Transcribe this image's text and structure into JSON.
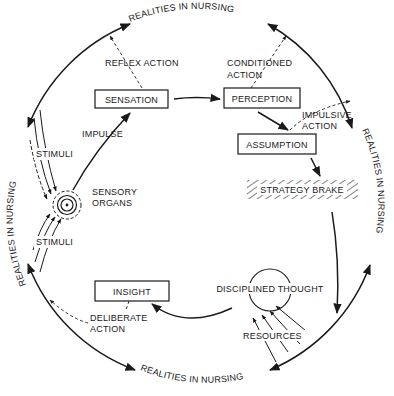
{
  "diagram": {
    "outer_cycle_label": "REALITIES IN NURSING",
    "outer_labels": [
      {
        "position": "top",
        "text": "REALITIES IN NURSING"
      },
      {
        "position": "right",
        "text": "REALITIES IN NURSING"
      },
      {
        "position": "bottom",
        "text": "REALITIES IN NURSING"
      },
      {
        "position": "left",
        "text": "REALITIES IN NURSING"
      }
    ],
    "nodes": {
      "sensation": "SENSATION",
      "perception": "PERCEPTION",
      "assumption": "ASSUMPTION",
      "strategy_brake": "STRATEGY BRAKE",
      "sensory_organs_line1": "SENSORY",
      "sensory_organs_line2": "ORGANS",
      "insight": "INSIGHT",
      "disciplined_thought": "DISCIPLINED THOUGHT"
    },
    "edge_labels": {
      "reflex_action": "REFLEX ACTION",
      "conditioned_action_line1": "CONDITIONED",
      "conditioned_action_line2": "ACTION",
      "impulsive_action_line1": "IMPULSIVE",
      "impulsive_action_line2": "ACTION",
      "impulse": "IMPULSE",
      "stimuli_upper": "STIMULI",
      "stimuli_lower": "STIMULI",
      "deliberate_action_line1": "DELIBERATE",
      "deliberate_action_line2": "ACTION",
      "resources": "RESOURCES"
    },
    "colors": {
      "ink": "#1a1a1a",
      "background": "#ffffff"
    }
  }
}
